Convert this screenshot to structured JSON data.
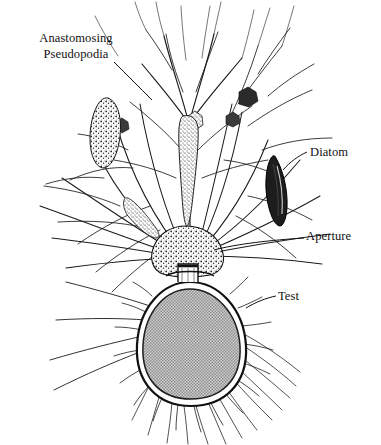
{
  "figure": {
    "background_color": "#ffffff",
    "ink_color": "#1a1a1a",
    "test_fill_color": "#a9a9a9"
  },
  "labels": {
    "pseudopodia": {
      "line1": "Anastomosing",
      "line2": "Pseudopodia"
    },
    "diatom": "Diatom",
    "aperture": "Aperture",
    "test": "Test"
  }
}
